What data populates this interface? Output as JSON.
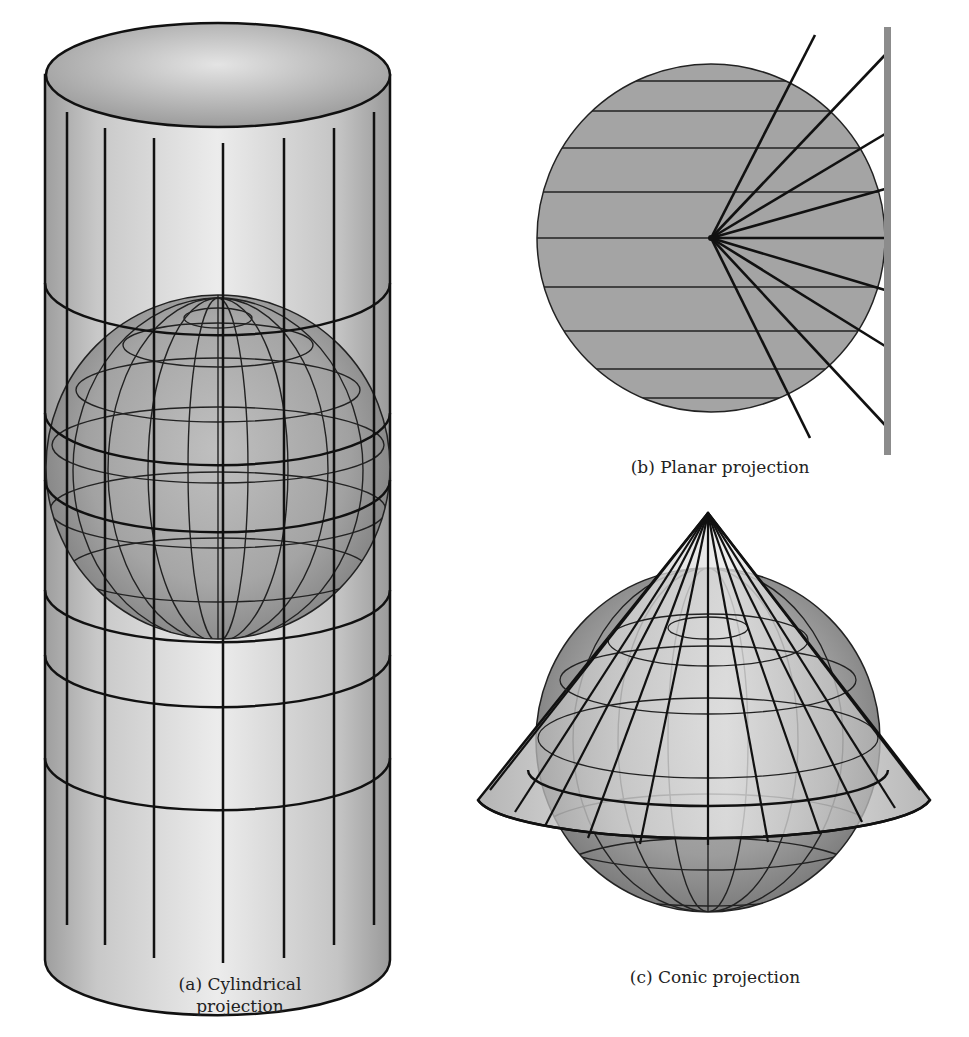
{
  "figure": {
    "panels": [
      {
        "id": "a",
        "caption_line1": "(a) Cylindrical",
        "caption_line2": "projection",
        "surface": "cylinder",
        "meridian_count": 9,
        "parallel_bands": 5
      },
      {
        "id": "b",
        "caption": "(b) Planar projection",
        "surface": "plane",
        "parallels_count": 9,
        "ray_count": 9
      },
      {
        "id": "c",
        "caption": "(c) Conic projection",
        "surface": "cone"
      }
    ],
    "colors": {
      "globe_fill": "#9a9a9a",
      "surface_light": "#e6e6e6",
      "surface_dark": "#a8a8a8",
      "line": "#111111",
      "plane_bar": "#8c8c8c",
      "planar_disc": "#a4a4a4"
    }
  }
}
